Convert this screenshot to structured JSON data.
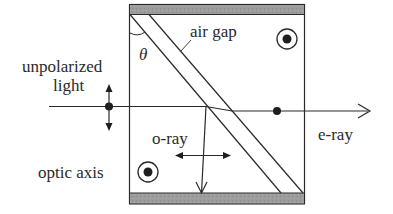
{
  "diagram": {
    "type": "Glan-Taylor / birefringent prism polarizer schematic",
    "labels": {
      "input": "unpolarized",
      "input_line2": "light",
      "air_gap": "air gap",
      "angle": "θ",
      "o_ray": "o-ray",
      "e_ray": "e-ray",
      "optic_axis": "optic axis"
    },
    "symbols": {
      "optic_axis_marker": "circled-dot (axis out of page)",
      "input_polarization": "dot + vertical double arrow (unpolarized)",
      "e_ray_polarization": "dot (out of page)",
      "o_ray_polarization": "horizontal double arrow"
    },
    "colors": {
      "line": "#2a2a2a",
      "bar_fill": "#9a9a9a",
      "background": "#ffffff"
    }
  }
}
